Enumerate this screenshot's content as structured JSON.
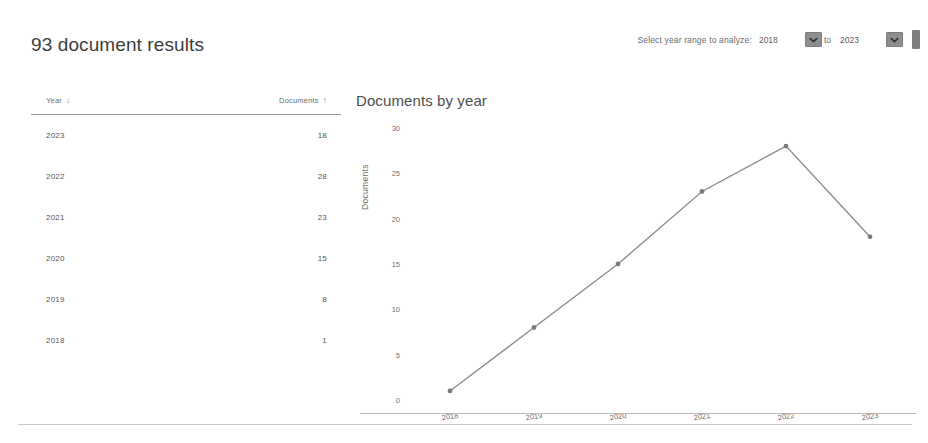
{
  "header": {
    "title": "93 document results",
    "year_range": {
      "label": "Select year range to analyze:",
      "from_value": "2018",
      "to_label": "to",
      "to_value": "2023",
      "dropdown_icon": "chevron-down-icon"
    }
  },
  "table": {
    "columns": [
      {
        "label": "Year",
        "sort_icon": "sort-descending-arrow",
        "sort_glyph": "↓"
      },
      {
        "label": "Documents",
        "sort_icon": "sort-ascending-arrow",
        "sort_glyph": "↑"
      }
    ],
    "rows": [
      {
        "year": "2023",
        "documents": "18"
      },
      {
        "year": "2022",
        "documents": "28"
      },
      {
        "year": "2021",
        "documents": "23"
      },
      {
        "year": "2020",
        "documents": "15"
      },
      {
        "year": "2019",
        "documents": "8"
      },
      {
        "year": "2018",
        "documents": "1"
      }
    ]
  },
  "chart_data": {
    "type": "line",
    "title": "Documents by year",
    "xlabel": "",
    "ylabel": "Documents",
    "categories": [
      "2018",
      "2019",
      "2020",
      "2021",
      "2022",
      "2023"
    ],
    "values": [
      1,
      8,
      15,
      23,
      28,
      18
    ],
    "series": [
      {
        "name": "Documents",
        "values": [
          1,
          8,
          15,
          23,
          28,
          18
        ]
      }
    ],
    "yticks": [
      0,
      5,
      10,
      15,
      20,
      25,
      30
    ],
    "ylim": [
      0,
      30
    ],
    "grid": false,
    "legend": "none",
    "line_color": "#8a8a8a",
    "marker_color": "#7a7a7a"
  },
  "colors": {
    "text": "#4a4a4a",
    "muted": "#6f6f6f",
    "rule": "#c9c9c9",
    "control": "#8e8e8e"
  }
}
